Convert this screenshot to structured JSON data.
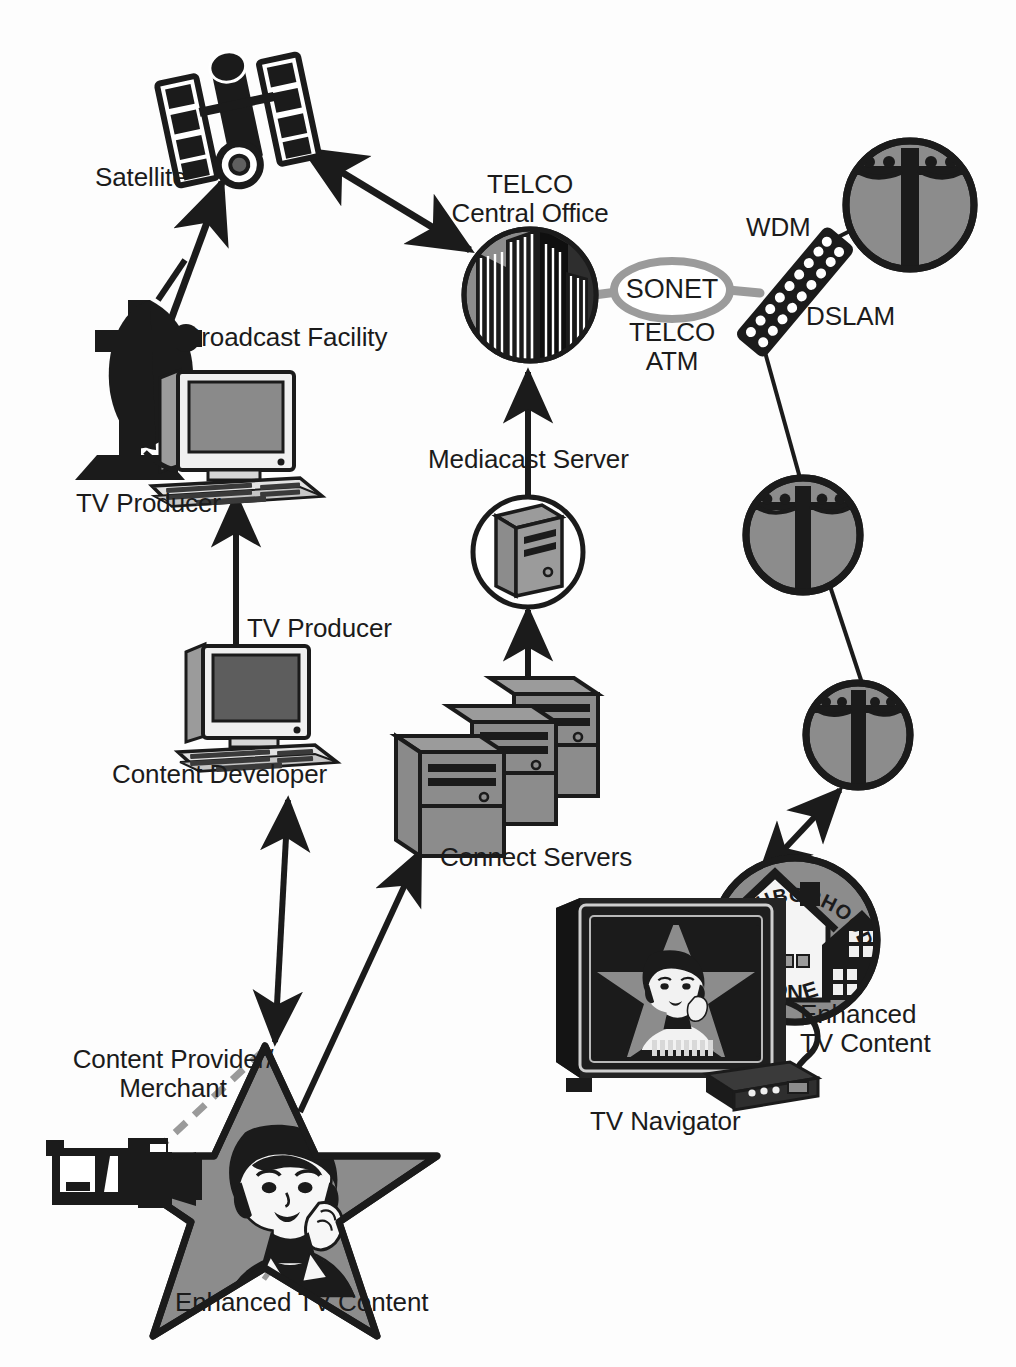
{
  "diagram": {
    "background_color": "#fdfdfd",
    "ink_color": "#1b1b1b",
    "fill_gray": "#8c8c8c",
    "mid_gray": "#a8a8a8",
    "dark_fill": "#2a2a2a",
    "dashed_gray": "#9a9a9a"
  },
  "labels": {
    "satellite": "Satellite",
    "telco_central_office": "TELCO\nCentral Office",
    "wdm": "WDM",
    "dslam": "DSLAM",
    "sonet": "SONET",
    "telco_atm": "TELCO\nATM",
    "broadcast_facility": "Broadcast Facility",
    "tv_producer_top": "TV Producer",
    "mediacast_server": "Mediacast Server",
    "tv_producer_mid": "TV Producer",
    "content_developer": "Content Developer",
    "connect_servers": "Connect Servers",
    "content_provider_merchant": "Content Provider/\nMerchant",
    "enhanced_tv_content_bottom": "Enhanced TV Content",
    "enhanced_tv_content_right": "Enhanced\nTV Content",
    "tv_navigator": "TV Navigator",
    "neighborhood_top": "NEIGHBORHOOD",
    "neighborhood_bottom": "ONE"
  },
  "nodes": [
    {
      "id": "satellite",
      "name": "satellite-icon",
      "label": "Satellite",
      "x": 238,
      "y": 120
    },
    {
      "id": "broadcast-facility",
      "name": "broadcast-dish-icon",
      "label": "Broadcast Facility",
      "x": 125,
      "y": 380
    },
    {
      "id": "tv-producer-workstation",
      "name": "tv-producer-workstation-icon",
      "label": "TV Producer",
      "x": 215,
      "y": 430
    },
    {
      "id": "content-developer-workstation",
      "name": "content-developer-workstation-icon",
      "label": "Content Developer",
      "x": 240,
      "y": 700
    },
    {
      "id": "telco-central-office",
      "name": "telco-central-office-icon",
      "label": "TELCO Central Office",
      "x": 530,
      "y": 295
    },
    {
      "id": "sonet-ring",
      "name": "sonet-ring-icon",
      "label": "SONET",
      "x": 672,
      "y": 290
    },
    {
      "id": "dslam",
      "name": "dslam-icon",
      "label": "DSLAM",
      "x": 795,
      "y": 290
    },
    {
      "id": "mediacast-server",
      "name": "mediacast-server-icon",
      "label": "Mediacast Server",
      "x": 528,
      "y": 552
    },
    {
      "id": "connect-servers",
      "name": "connect-servers-icon",
      "label": "Connect Servers",
      "x": 495,
      "y": 770
    },
    {
      "id": "pole-1",
      "name": "telephone-pole-icon",
      "label": "",
      "x": 910,
      "y": 205
    },
    {
      "id": "pole-2",
      "name": "telephone-pole-icon",
      "label": "",
      "x": 803,
      "y": 535
    },
    {
      "id": "pole-3",
      "name": "telephone-pole-icon",
      "label": "",
      "x": 858,
      "y": 735
    },
    {
      "id": "neighborhood-one",
      "name": "neighborhood-one-badge",
      "label": "NEIGHBORHOOD ONE",
      "x": 795,
      "y": 940
    },
    {
      "id": "tv-navigator",
      "name": "tv-navigator-icon",
      "label": "TV Navigator",
      "x": 660,
      "y": 990
    },
    {
      "id": "set-top-box",
      "name": "set-top-box-icon",
      "label": "",
      "x": 750,
      "y": 1075
    },
    {
      "id": "star-content",
      "name": "enhanced-tv-star-icon",
      "label": "Enhanced TV Content",
      "x": 265,
      "y": 1145
    },
    {
      "id": "camcorder",
      "name": "camcorder-icon",
      "label": "",
      "x": 95,
      "y": 1175
    }
  ],
  "connections": [
    {
      "from": "broadcast-facility",
      "to": "satellite",
      "style": "arrow",
      "heads": "single"
    },
    {
      "from": "satellite",
      "to": "telco-central-office",
      "style": "arrow",
      "heads": "double"
    },
    {
      "from": "telco-central-office",
      "to": "sonet-ring",
      "style": "thick-gray-line",
      "heads": "none"
    },
    {
      "from": "sonet-ring",
      "to": "dslam",
      "style": "thick-gray-line",
      "heads": "none"
    },
    {
      "from": "dslam",
      "to": "pole-1",
      "style": "line",
      "heads": "none"
    },
    {
      "from": "dslam",
      "to": "pole-2",
      "style": "line",
      "heads": "none"
    },
    {
      "from": "pole-2",
      "to": "pole-3",
      "style": "line",
      "heads": "none"
    },
    {
      "from": "pole-3",
      "to": "neighborhood-one",
      "style": "arrow",
      "heads": "double"
    },
    {
      "from": "mediacast-server",
      "to": "telco-central-office",
      "style": "arrow",
      "heads": "single"
    },
    {
      "from": "connect-servers",
      "to": "mediacast-server",
      "style": "arrow",
      "heads": "single"
    },
    {
      "from": "content-developer-workstation",
      "to": "tv-producer-workstation",
      "style": "arrow",
      "heads": "single"
    },
    {
      "from": "star-content",
      "to": "content-developer-workstation",
      "style": "arrow",
      "heads": "double"
    },
    {
      "from": "star-content",
      "to": "connect-servers",
      "style": "arrow",
      "heads": "single"
    },
    {
      "from": "camcorder",
      "to": "star-content",
      "style": "dashed-cone",
      "heads": "none"
    }
  ]
}
